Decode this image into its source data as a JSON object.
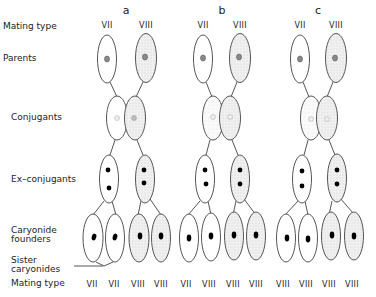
{
  "row_labels": {
    "mating_type_top": "Mating type",
    "parents": "Parents",
    "conjugants": "Conjugants",
    "ex_conjugants": "Ex–conjugants",
    "caryonide_founders_1": "Caryonide",
    "caryonide_founders_2": "founders",
    "sister_caryonides_1": "Sister",
    "sister_caryonides_2": "caryonides",
    "mating_type_bottom": "Mating type"
  },
  "panels": [
    {
      "letter": "a",
      "parents": [
        "VII",
        "VIII"
      ],
      "caryonides": [
        "VII",
        "VII",
        "VIII",
        "VIII"
      ]
    },
    {
      "letter": "b",
      "parents": [
        "VII",
        "VIII"
      ],
      "caryonides": [
        "VII",
        "VIII",
        "VIII",
        "VIII"
      ]
    },
    {
      "letter": "c",
      "parents": [
        "VII",
        "VIII"
      ],
      "caryonides": [
        "VIII",
        "VIII",
        "VIII",
        "VIII"
      ]
    }
  ],
  "colors": {
    "outline": "#555555",
    "stipple": "#e6e6e6",
    "white_cell": "#ffffff",
    "macronucleus": "#000000",
    "parent_nucleus": "#888888"
  }
}
